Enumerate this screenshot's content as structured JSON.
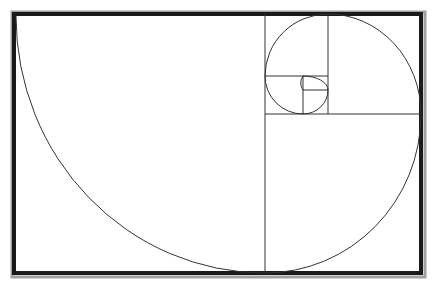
{
  "diagram": {
    "colors": {
      "background": "#ffffff",
      "frame": "#1a1a1a",
      "frame_shadow": "#9a9a9a",
      "lines": "#333333"
    },
    "frame": {
      "x": 14,
      "y": 14,
      "width": 407,
      "height": 259
    },
    "divisions": [
      {
        "x1": 265,
        "y1": 14,
        "x2": 265,
        "y2": 273
      },
      {
        "x1": 265,
        "y1": 114,
        "x2": 421,
        "y2": 114
      },
      {
        "x1": 328,
        "y1": 14,
        "x2": 328,
        "y2": 114
      },
      {
        "x1": 265,
        "y1": 76,
        "x2": 328,
        "y2": 76
      },
      {
        "x1": 303,
        "y1": 76,
        "x2": 303,
        "y2": 114
      },
      {
        "x1": 303,
        "y1": 90,
        "x2": 328,
        "y2": 90
      }
    ],
    "spiral_path": "M 16 16 A 249 257 0 0 0 265 273 A 156 159 0 0 0 421 114 A 93 100 0 0 0 328 14 A 63 62 0 0 0 265 76 A 38 38 0 0 0 303 114 A 25 24 0 0 0 328 90 A 25 14 0 0 0 303 76 A 12 12 0 0 0 303 90"
  }
}
